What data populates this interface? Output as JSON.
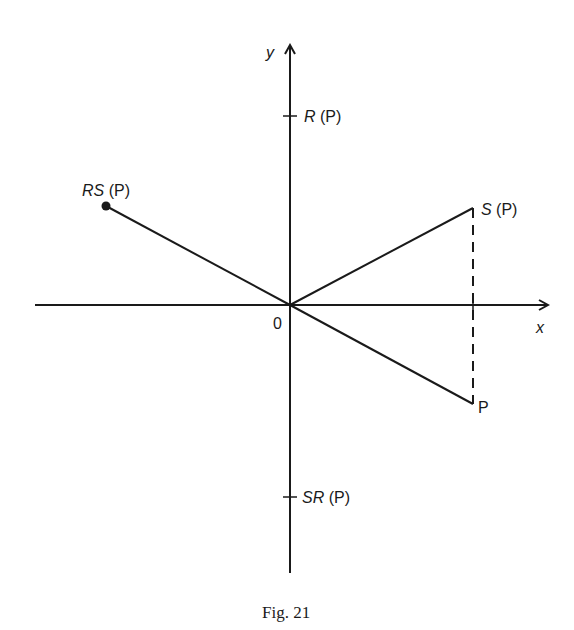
{
  "figure": {
    "caption": "Fig. 21",
    "origin_label": "0",
    "axes": {
      "x_label": "x",
      "y_label": "y"
    },
    "points": [
      {
        "id": "R",
        "name": "R",
        "suffix": " (P)",
        "position": "positive y-axis"
      },
      {
        "id": "SR",
        "name": "SR",
        "suffix": " (P)",
        "position": "negative y-axis"
      },
      {
        "id": "RS",
        "name": "RS",
        "suffix": " (P)",
        "position": "upper-left, dot endpoint"
      },
      {
        "id": "S",
        "name": "S",
        "suffix": " (P)",
        "position": "upper-right"
      },
      {
        "id": "P",
        "name": "P",
        "suffix": "",
        "position": "lower-right"
      }
    ],
    "segments": [
      {
        "from": "0",
        "to": "RS",
        "style": "solid"
      },
      {
        "from": "0",
        "to": "S",
        "style": "solid"
      },
      {
        "from": "0",
        "to": "P",
        "style": "solid"
      },
      {
        "from": "S",
        "to": "P",
        "style": "dashed"
      }
    ],
    "colors": {
      "ink": "#1a1a1a",
      "background": "#ffffff"
    }
  }
}
